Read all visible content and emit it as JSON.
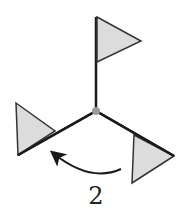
{
  "diagram": {
    "label": "2",
    "colors": {
      "line": "#1a1a1a",
      "flag_fill": "#dcdcdc",
      "hub": "#999999"
    },
    "elements": [
      "center-hub",
      "top-flag",
      "left-flag",
      "right-flag",
      "rotation-arrow"
    ]
  }
}
